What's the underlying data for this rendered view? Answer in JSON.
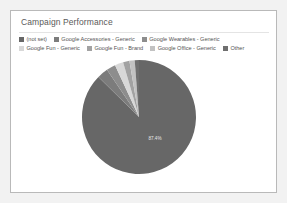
{
  "card": {
    "title": "Campaign Performance"
  },
  "legend": {
    "position": "top",
    "items": [
      {
        "label": "(not set)",
        "color": "#676767"
      },
      {
        "label": "Google Accessories - Generic",
        "color": "#7c7c7c"
      },
      {
        "label": "Google Wearables - Generic",
        "color": "#8d8d8d"
      },
      {
        "label": "Google Fun - Generic",
        "color": "#d8d8d8"
      },
      {
        "label": "Google Fun - Brand",
        "color": "#a2a2a2"
      },
      {
        "label": "Google Office - Generic",
        "color": "#c2c2c2"
      },
      {
        "label": "Other",
        "color": "#6f6f6f"
      }
    ]
  },
  "chart_data": {
    "type": "pie",
    "title": "Campaign Performance",
    "xlabel": "",
    "ylabel": "",
    "legend_position": "top",
    "start_angle_deg": 0,
    "direction": "clockwise",
    "labels": [
      "(not set)",
      "Google Accessories - Generic",
      "Google Wearables - Generic",
      "Google Fun - Generic",
      "Google Fun - Brand",
      "Google Office - Generic",
      "Other"
    ],
    "values": [
      87.4,
      3.1,
      2.6,
      2.4,
      1.8,
      1.5,
      1.2
    ],
    "colors": [
      "#676767",
      "#7c7c7c",
      "#8d8d8d",
      "#d8d8d8",
      "#a2a2a2",
      "#c2c2c2",
      "#6f6f6f"
    ],
    "value_unit": "percent",
    "data_labels": [
      {
        "label": "87.4%",
        "series": "(not set)",
        "shown": true
      }
    ],
    "visible_data_labels": [
      "87.4%"
    ]
  }
}
